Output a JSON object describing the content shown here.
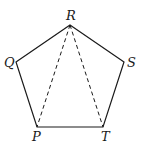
{
  "diagram": {
    "type": "regular pentagon with diagonals",
    "vertices": [
      {
        "label": "R",
        "x": 70,
        "y": 25
      },
      {
        "label": "S",
        "x": 124,
        "y": 62
      },
      {
        "label": "T",
        "x": 103,
        "y": 127
      },
      {
        "label": "P",
        "x": 37,
        "y": 127
      },
      {
        "label": "Q",
        "x": 16,
        "y": 62
      }
    ],
    "labels": {
      "R": "R",
      "S": "S",
      "T": "T",
      "P": "P",
      "Q": "Q"
    },
    "dashed_segments": [
      [
        "R",
        "P"
      ],
      [
        "R",
        "T"
      ]
    ],
    "colors": {
      "stroke": "#1a1a1a",
      "background": "#ffffff"
    }
  }
}
